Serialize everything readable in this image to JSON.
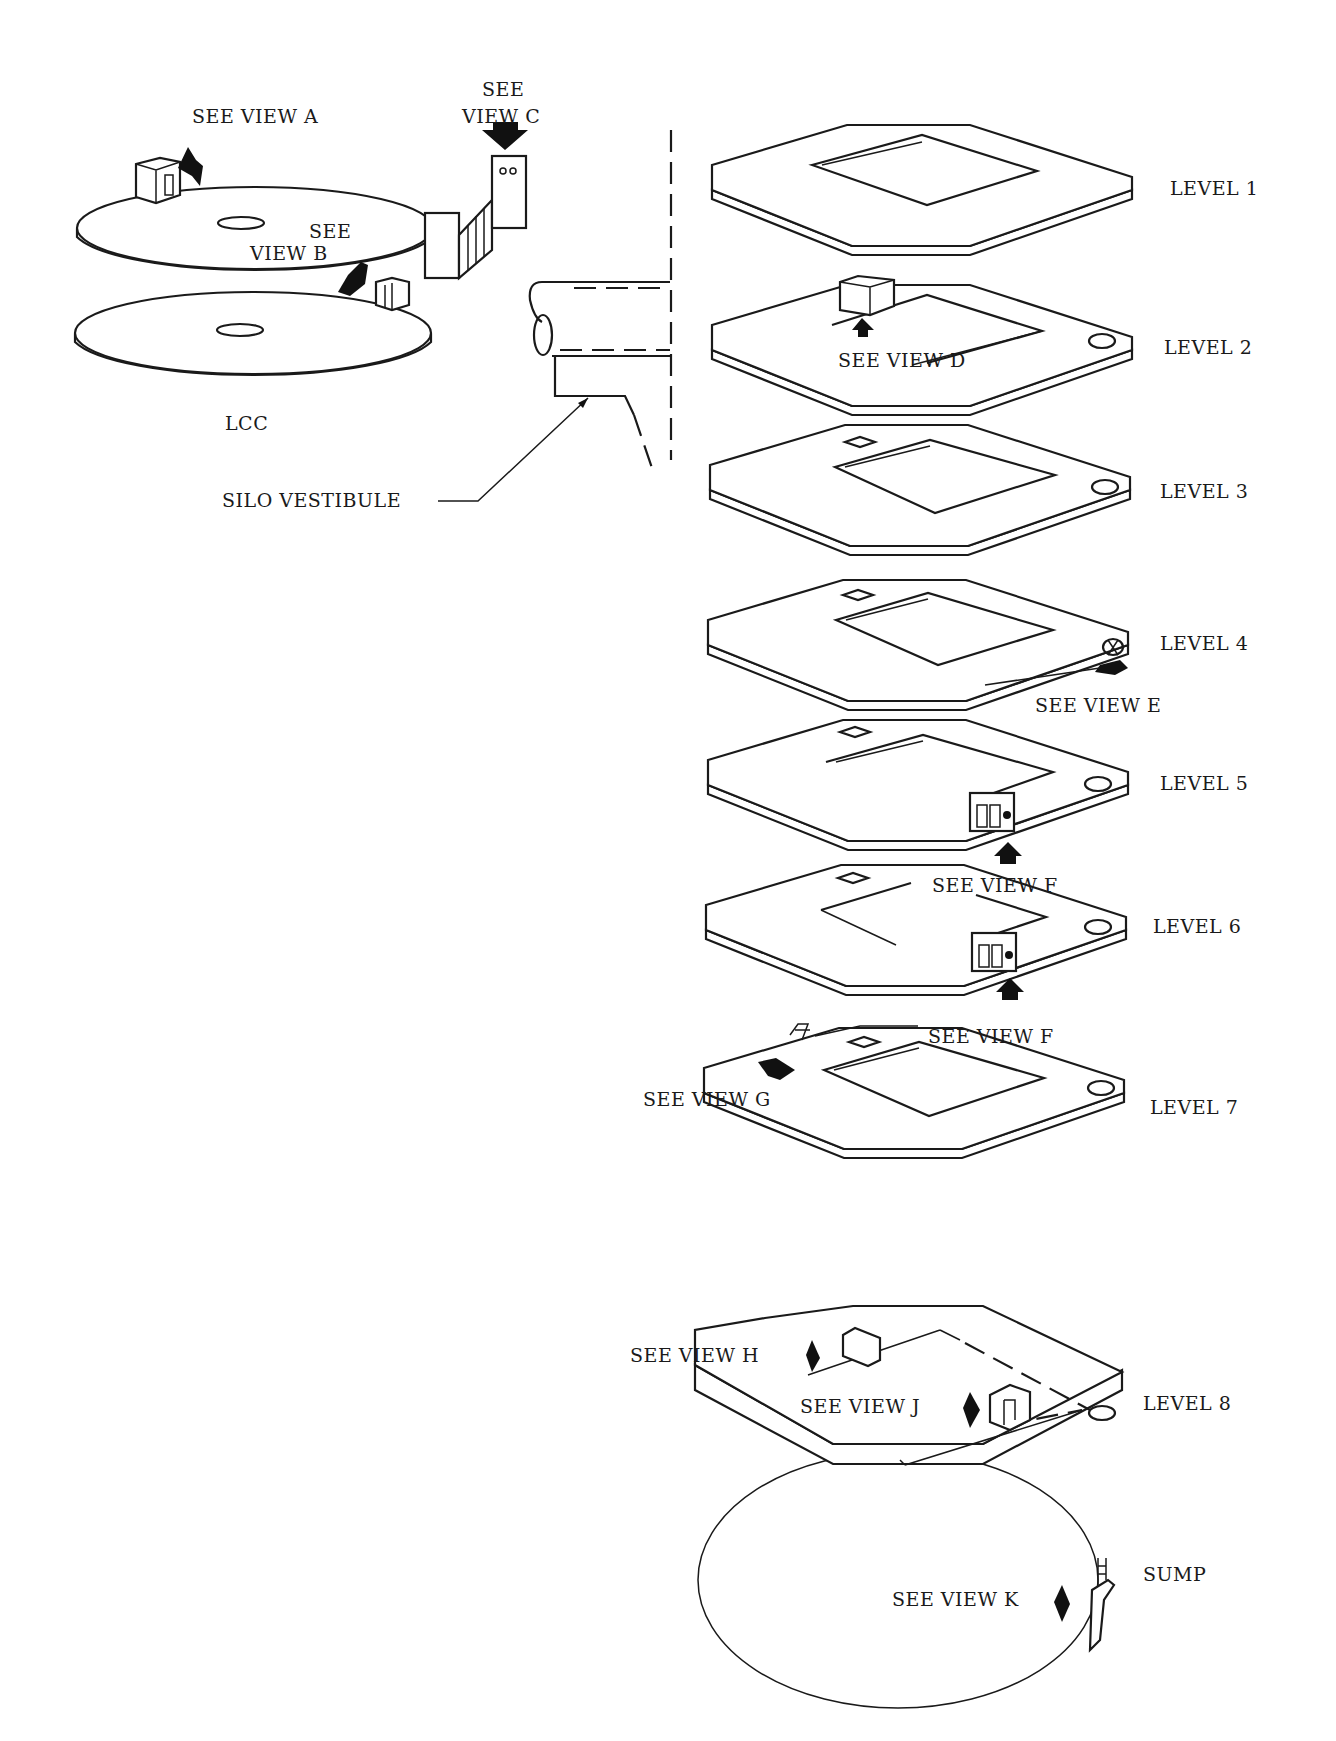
{
  "figure": {
    "lcc": {
      "label": "LCC",
      "callouts": {
        "view_a": "SEE VIEW A",
        "view_b_line1": "SEE",
        "view_b_line2": "VIEW B",
        "view_c_line1": "SEE",
        "view_c_line2": "VIEW C"
      }
    },
    "vestibule": {
      "label": "SILO VESTIBULE"
    },
    "levels": [
      {
        "label": "LEVEL 1",
        "callouts": []
      },
      {
        "label": "LEVEL 2",
        "callouts": [
          "SEE VIEW D"
        ]
      },
      {
        "label": "LEVEL 3",
        "callouts": []
      },
      {
        "label": "LEVEL 4",
        "callouts": [
          "SEE VIEW E"
        ]
      },
      {
        "label": "LEVEL 5",
        "callouts": []
      },
      {
        "label": "LEVEL 6",
        "callouts": [
          "SEE VIEW F"
        ]
      },
      {
        "label": "LEVEL 7",
        "callouts": [
          "SEE VIEW F",
          "SEE VIEW G"
        ]
      },
      {
        "label": "LEVEL 8",
        "callouts": [
          "SEE VIEW H",
          "SEE VIEW J"
        ]
      }
    ],
    "sump": {
      "label": "SUMP",
      "callouts": [
        "SEE VIEW K"
      ]
    }
  }
}
